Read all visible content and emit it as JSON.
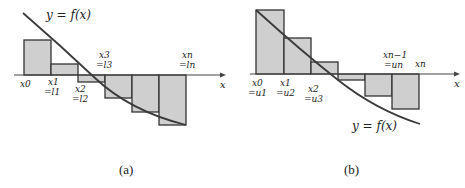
{
  "figure": {
    "colors": {
      "fill": "#cfcfcf",
      "stroke": "#333333",
      "curve": "#3a3a3a",
      "text": "#222222"
    },
    "panel_a": {
      "caption": "(a)",
      "curve_label": "y = f(x)",
      "axis_label": "x",
      "title": "Lower sum rectangles for a decreasing function",
      "tick_labels": {
        "x0": "x0",
        "x1": "x1",
        "x1_eq": "=l1",
        "x2": "x2",
        "x2_eq": "=l2",
        "x3": "x3",
        "x3_eq": "=l3",
        "xn": "xn",
        "xn_eq": "=ln"
      }
    },
    "panel_b": {
      "caption": "(b)",
      "curve_label": "y = f(x)",
      "axis_label": "x",
      "title": "Upper sum rectangles for a decreasing function",
      "tick_labels": {
        "x0": "x0",
        "x0_eq": "=u1",
        "x1": "x1",
        "x1_eq": "=u2",
        "x2": "x2",
        "x2_eq": "=u3",
        "xn1": "xn−1",
        "xn1_eq": "=un",
        "xn": "xn"
      }
    }
  }
}
